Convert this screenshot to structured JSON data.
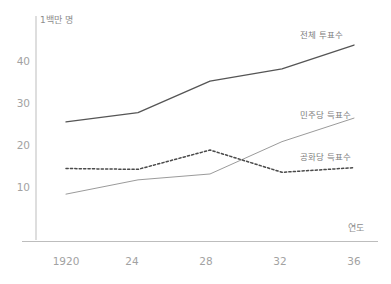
{
  "chart_data": {
    "type": "line",
    "title": "",
    "xlabel": "연도",
    "ylabel": "1백만 명",
    "x": [
      1920,
      1924,
      1928,
      1932,
      1936
    ],
    "xtick_labels": [
      "1920",
      "24",
      "28",
      "32",
      "36"
    ],
    "ytick_labels": [
      "10",
      "20",
      "30",
      "40"
    ],
    "ytick_values": [
      10,
      20,
      30,
      40
    ],
    "ylim": [
      0,
      47
    ],
    "xlim": [
      1920,
      1936
    ],
    "grid": false,
    "legend_position": "inline-right",
    "series": [
      {
        "name": "전체 투표수",
        "style": "solid",
        "color": "#555555",
        "values": [
          25.5,
          27.7,
          35.2,
          38.1,
          43.8
        ]
      },
      {
        "name": "민주당 득표수",
        "style": "solid",
        "color": "#9b9b9b",
        "values": [
          8.3,
          11.7,
          13.1,
          20.8,
          26.4
        ]
      },
      {
        "name": "공화당 득표수",
        "style": "dotted",
        "color": "#4a4a4a",
        "values": [
          14.4,
          14.2,
          18.8,
          13.5,
          14.6
        ]
      }
    ]
  },
  "axis": {
    "y_unit_label": "1백만 명",
    "x_name_label": "연도"
  },
  "labels": {
    "total_votes": "전체 투표수",
    "democratic_votes": "민주당 득표수",
    "republican_votes": "공화당 득표수"
  },
  "ticks": {
    "y": [
      "40",
      "30",
      "20",
      "10"
    ],
    "x": [
      "1920",
      "24",
      "28",
      "32",
      "36"
    ]
  }
}
